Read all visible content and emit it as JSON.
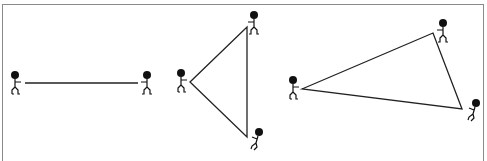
{
  "diagram": {
    "colors": {
      "rope": "#222222",
      "figure": "#111111",
      "frame": "#8a8a8a",
      "background": "#ffffff"
    },
    "panels": [
      {
        "name": "line",
        "figures": [
          {
            "x": 15,
            "y": 75,
            "facing": "right"
          },
          {
            "x": 147,
            "y": 75,
            "facing": "left"
          }
        ],
        "rope": [
          [
            25,
            83
          ],
          [
            138,
            83
          ]
        ]
      },
      {
        "name": "triangle-isosceles",
        "figures": [
          {
            "x": 181,
            "y": 73,
            "facing": "right"
          },
          {
            "x": 254,
            "y": 15,
            "facing": "left"
          },
          {
            "x": 259,
            "y": 132,
            "facing": "down-left"
          }
        ],
        "rope": [
          [
            190,
            82
          ],
          [
            247,
            27
          ],
          [
            247,
            137
          ]
        ]
      },
      {
        "name": "triangle-scalene",
        "figures": [
          {
            "x": 293,
            "y": 80,
            "facing": "right"
          },
          {
            "x": 443,
            "y": 23,
            "facing": "left"
          },
          {
            "x": 476,
            "y": 103,
            "facing": "down-left"
          }
        ],
        "rope": [
          [
            302,
            89
          ],
          [
            433,
            33
          ],
          [
            462,
            109
          ]
        ]
      }
    ]
  }
}
